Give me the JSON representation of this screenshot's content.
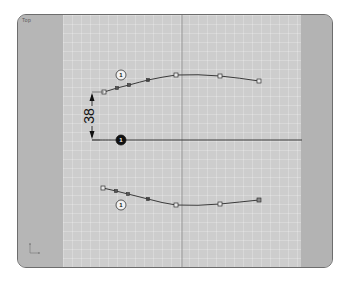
{
  "viewport": {
    "corner_label": "Top",
    "colors": {
      "frame_border": "#6d6d6d",
      "side_panel": "#b6b6b6",
      "grid_background": "#cdcdcd",
      "curve": "#3a3a3a",
      "dimension": "#111111"
    }
  },
  "dimension": {
    "value": "38",
    "orientation": "vertical"
  },
  "curves": {
    "upper": {
      "label": "1",
      "points": [
        [
          104,
          92
        ],
        [
          117,
          88
        ],
        [
          129,
          85
        ],
        [
          148,
          80
        ],
        [
          176,
          75
        ],
        [
          220,
          76
        ],
        [
          259,
          81
        ]
      ]
    },
    "reference_line": {
      "label": "1",
      "from": [
        92,
        140
      ],
      "to": [
        302,
        140
      ]
    },
    "lower": {
      "label": "1",
      "points": [
        [
          103,
          188
        ],
        [
          116,
          191
        ],
        [
          128,
          194
        ],
        [
          148,
          199
        ],
        [
          176,
          205
        ],
        [
          220,
          204
        ],
        [
          259,
          200
        ]
      ]
    }
  },
  "axis_icon": "axis-triad-icon"
}
